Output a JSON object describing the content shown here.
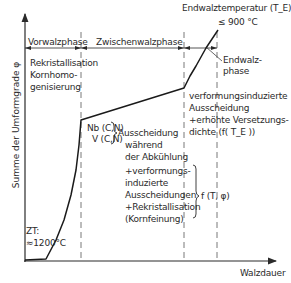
{
  "diagram": {
    "y_axis_label": "Summe der Umformgrade φ",
    "x_axis_label": "Walzdauer",
    "phases": {
      "vorwalz": "Vorwalzphase",
      "zwischenwalz": "Zwischenwalzphase",
      "endwalz_line1": "Endwalz-",
      "endwalz_line2": "phase"
    },
    "end_temperature": {
      "line1": "Endwalztemperatur (T_E):",
      "line2": "≤ 900 °C"
    },
    "start_temperature": {
      "line1": "ZT:",
      "line2": "≈1200°C"
    },
    "vorwalz_notes": [
      "Rekristallisation",
      "Kornhomo-",
      "genisierung"
    ],
    "precipitates": [
      "Nb (C,N)",
      "V (C,N)"
    ],
    "zwischen_notes": [
      "Ausscheidung",
      "während",
      "der Abkühlung",
      "+verformungs-",
      "induzierte",
      "Ausscheidungen",
      "+Rekristallisation",
      "(Kornfeinung)"
    ],
    "function_label": "f (T, φ)",
    "endwalz_notes": [
      "verformungsinduzierte",
      "Ausscheidung",
      "+erhöhte Versetzungs-",
      "dichte (f( T_E ))"
    ]
  }
}
